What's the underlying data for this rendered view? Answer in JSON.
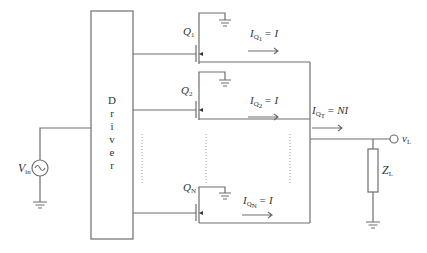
{
  "diagram": {
    "driver_label": [
      "D",
      "r",
      "i",
      "v",
      "e",
      "r"
    ],
    "source": {
      "name": "V",
      "sub": "in"
    },
    "transistors": [
      {
        "name": "Q",
        "sub": "1",
        "current_label": "I",
        "current_sub": "Q",
        "current_sub2": "1",
        "current_value": "= I"
      },
      {
        "name": "Q",
        "sub": "2",
        "current_label": "I",
        "current_sub": "Q",
        "current_sub2": "2",
        "current_value": "= I"
      },
      {
        "name": "Q",
        "sub": "N",
        "current_label": "I",
        "current_sub": "Q",
        "current_sub2": "N",
        "current_value": "= I"
      }
    ],
    "total_current": {
      "label": "I",
      "sub": "Q",
      "sub2": "T",
      "value": "= NI"
    },
    "output": {
      "name": "v",
      "sub": "L"
    },
    "load": {
      "name": "Z",
      "sub": "L"
    }
  }
}
